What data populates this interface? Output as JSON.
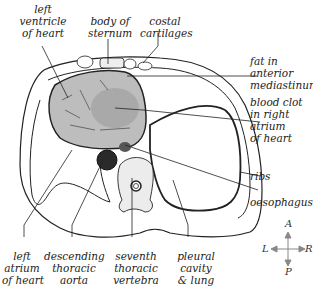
{
  "diagram": {
    "type": "anatomical cross-section (transverse section of thorax)",
    "labels": {
      "left_ventricle": "left\nventricle\nof heart",
      "body_of_sternum": "body of\nsternum",
      "costal_cartilages": "costal\ncartilages",
      "fat_anterior_mediastinum": "fat in\nanterior\nmediastinum",
      "blood_clot_right_atrium": "blood clot\nin right\natrium\nof heart",
      "ribs": "ribs",
      "oesophagus": "oesophagus",
      "left_atrium": "left\natrium\nof heart",
      "descending_thoracic_aorta": "descending\nthoracic\naorta",
      "seventh_thoracic_vertebra": "seventh\nthoracic\nvertebra",
      "pleural_cavity_lung": "pleural\ncavity\n& lung"
    },
    "compass": {
      "up": "A",
      "down": "P",
      "left": "L",
      "right": "R"
    },
    "colors": {
      "heart_fill": "#bdbdbd",
      "clot_fill": "#a9a9a9",
      "aorta_fill": "#2a2a2a",
      "line": "#222222",
      "vertebra_fill": "#ececec"
    }
  }
}
